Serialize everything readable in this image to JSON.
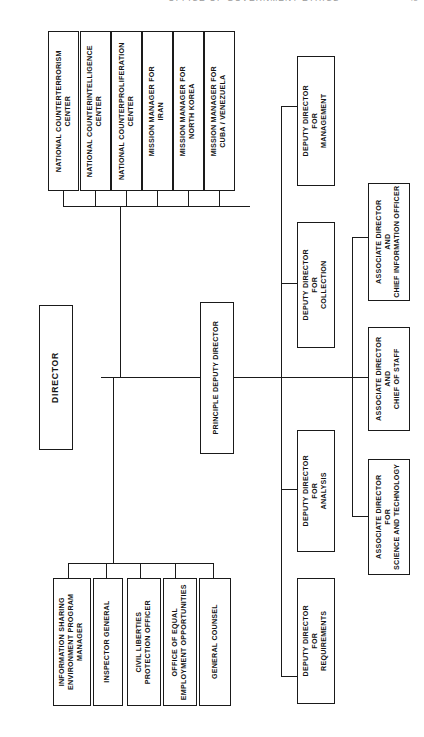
{
  "page": {
    "header_text": "OFFICE OF GOVERNMENT ETHICS",
    "page_number": "45"
  },
  "chart_data": {
    "type": "diagram",
    "orientation": "rotated-90-counterclockwise",
    "root": "DIRECTOR",
    "nodes": {
      "director": "DIRECTOR",
      "principal_deputy": "PRINCIPLE DEPUTY DIRECTOR",
      "centers": [
        "NATIONAL COUNTERTERRORISM CENTER",
        "NATIONAL COUNTERINTELLIGENCE CENTER",
        "NATIONAL COUNTERPROLIFERATION CENTER",
        "MISSION MANAGER FOR IRAN",
        "MISSION MANAGER FOR NORTH KOREA",
        "MISSION MANAGER FOR CUBA / VENEZUELA"
      ],
      "staff_offices": [
        "INFORMATION SHARING ENVIRONMENT PROGRAM MANAGER",
        "INSPECTOR GENERAL",
        "CIVIL LIBERTIES PROTECTION OFFICER",
        "OFFICE OF EQUAL EMPLOYMENT OPPORTUNITIES",
        "GENERAL COUNSEL"
      ],
      "deputy_directors": [
        "DEPUTY DIRECTOR FOR MANAGEMENT",
        "DEPUTY DIRECTOR FOR COLLECTION",
        "DEPUTY DIRECTOR FOR ANALYSIS",
        "DEPUTY DIRECTOR FOR REQUIREMENTS"
      ],
      "associate_directors": [
        "ASSOCIATE DIRECTOR AND CHIEF INFORMATION OFFICER",
        "ASSOCIATE DIRECTOR AND CHIEF OF STAFF",
        "ASSOCIATE DIRECTOR FOR SCIENCE AND TECHNOLOGY"
      ]
    },
    "boxes": [
      {
        "id": "ctr-nctc",
        "lines": [
          "NATIONAL COUNTERTERRORISM",
          "CENTER"
        ]
      },
      {
        "id": "ctr-ncix",
        "lines": [
          "NATIONAL COUNTERINTELLIGENCE",
          "CENTER"
        ]
      },
      {
        "id": "ctr-ncpc",
        "lines": [
          "NATIONAL COUNTERPROLIFERATION",
          "CENTER"
        ]
      },
      {
        "id": "mm-iran",
        "lines": [
          "MISSION MANAGER FOR",
          "IRAN"
        ]
      },
      {
        "id": "mm-nk",
        "lines": [
          "MISSION MANAGER FOR",
          "NORTH KOREA"
        ]
      },
      {
        "id": "mm-cuba",
        "lines": [
          "MISSION MANAGER FOR",
          "CUBA / VENEZUELA"
        ]
      },
      {
        "id": "director",
        "lines": [
          "DIRECTOR"
        ]
      },
      {
        "id": "pdd",
        "lines": [
          "PRINCIPLE DEPUTY DIRECTOR"
        ]
      },
      {
        "id": "dd-mgmt",
        "lines": [
          "DEPUTY DIRECTOR",
          "FOR",
          "MANAGEMENT"
        ]
      },
      {
        "id": "dd-coll",
        "lines": [
          "DEPUTY DIRECTOR",
          "FOR",
          "COLLECTION"
        ]
      },
      {
        "id": "dd-anal",
        "lines": [
          "DEPUTY DIRECTOR",
          "FOR",
          "ANALYSIS"
        ]
      },
      {
        "id": "dd-req",
        "lines": [
          "DEPUTY DIRECTOR",
          "FOR",
          "REQUIREMENTS"
        ]
      },
      {
        "id": "ad-cio",
        "lines": [
          "ASSOCIATE DIRECTOR",
          "AND",
          "CHIEF INFORMATION OFFICER"
        ]
      },
      {
        "id": "ad-cos",
        "lines": [
          "ASSOCIATE DIRECTOR",
          "AND",
          "CHIEF OF STAFF"
        ]
      },
      {
        "id": "ad-st",
        "lines": [
          "ASSOCIATE DIRECTOR",
          "FOR",
          "SCIENCE AND TECHNOLOGY"
        ]
      },
      {
        "id": "staff-ise",
        "lines": [
          "INFORMATION SHARING",
          "ENVIRONMENT PROGRAM",
          "MANAGER"
        ]
      },
      {
        "id": "staff-ig",
        "lines": [
          "INSPECTOR GENERAL"
        ]
      },
      {
        "id": "staff-clpo",
        "lines": [
          "CIVIL LIBERTIES",
          "PROTECTION OFFICER"
        ]
      },
      {
        "id": "staff-eeo",
        "lines": [
          "OFFICE OF EQUAL",
          "EMPLOYMENT OPPORTUNITIES"
        ]
      },
      {
        "id": "staff-gc",
        "lines": [
          "GENERAL COUNSEL"
        ]
      }
    ]
  }
}
